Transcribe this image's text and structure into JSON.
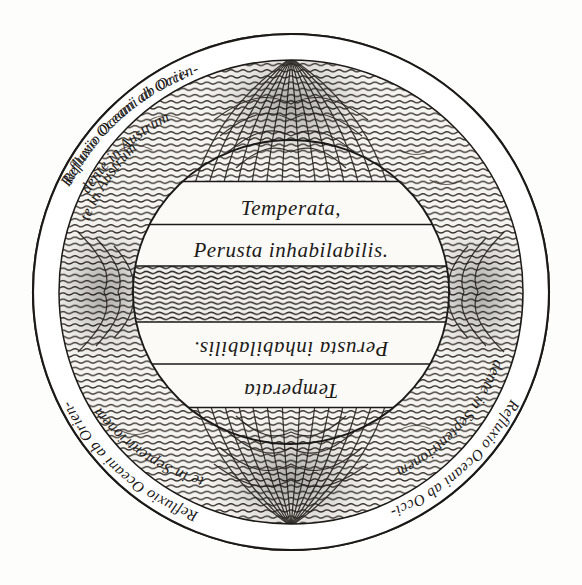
{
  "figure": {
    "title": "Refluxio Oceani",
    "shape": "circle",
    "ink_color": "#1c1a18",
    "paper_color": "#fdfdfc",
    "hatch_color": "#3a3632"
  },
  "rim_inscriptions": [
    {
      "id": "upper-left",
      "quadrant": "north-west",
      "line1": "Refluxio Oceani ab Orien-",
      "line2": "te in Austrum",
      "orientation": "upright",
      "text": "Refluxio Oceani ab Orien- te in Austrum"
    },
    {
      "id": "upper-right",
      "quadrant": "north-east",
      "line1": "Refluxio Oceani ab Occi-",
      "line2": "dente in Austrum",
      "orientation": "inverted",
      "text": "Refluxio Oceani ab Occi- dente in Austrum"
    },
    {
      "id": "lower-right",
      "quadrant": "south-east",
      "line1": "Refluxio Oceani ab Occi-",
      "line2": "dente in Septentrionem",
      "orientation": "inverted",
      "text": "Refluxio Oceani ab Occi- dente in Septentrionem"
    },
    {
      "id": "lower-left",
      "quadrant": "south-west",
      "line1": "Refluxio Oceani ab Orien-",
      "line2": "te in Septentrionem",
      "orientation": "upright",
      "text": "Refluxio Oceani ab Orien- te in Septentrionem"
    }
  ],
  "zone_bands": [
    {
      "id": "north-temperate",
      "label": "Temperata,",
      "orientation": "upright",
      "position": "upper"
    },
    {
      "id": "north-torrid",
      "label": "Perusta inhabilabilis.",
      "orientation": "upright",
      "position": "upper-middle"
    },
    {
      "id": "south-torrid",
      "label": "Perusta inhabilabilis.",
      "orientation": "inverted",
      "position": "lower-middle"
    },
    {
      "id": "south-temperate",
      "label": "Temperata",
      "orientation": "inverted",
      "position": "lower"
    }
  ],
  "flow_features": {
    "north_pole_vortex": "convergent flow lines at top",
    "south_pole_vortex": "convergent flow lines at bottom",
    "east_vortex": "swirling eddy at right margin",
    "west_vortex": "swirling eddy at left margin"
  }
}
